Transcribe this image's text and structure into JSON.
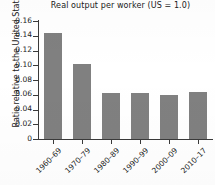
{
  "chart_data": {
    "type": "bar",
    "title": "Real output per worker (US = 1.0)",
    "xlabel": "",
    "ylabel": "Ratio relative to the United States",
    "categories": [
      "1960–69",
      "1970–79",
      "1980–89",
      "1990–99",
      "2000–09",
      "2010–17"
    ],
    "values": [
      0.144,
      0.102,
      0.062,
      0.062,
      0.06,
      0.064
    ],
    "ylim": [
      0,
      0.16
    ],
    "ytick_labels": [
      "0",
      "0.02",
      "0.04",
      "0.06",
      "0.08",
      "0.10",
      "0.12",
      "0.14",
      "0.16"
    ],
    "ytick_values": [
      0,
      0.02,
      0.04,
      0.06,
      0.08,
      0.1,
      0.12,
      0.14,
      0.16
    ],
    "grid": false,
    "legend": false,
    "bar_color": "#808080",
    "axis_color": "#3a3a3a",
    "background": "#ffffff"
  }
}
